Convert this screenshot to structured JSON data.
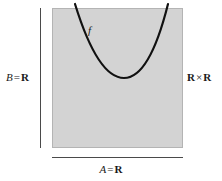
{
  "figure": {
    "background_color": "#ffffff",
    "square": {
      "name": "product-square",
      "fill_color": "#d3d3d3",
      "border_color": "#b4b4b4",
      "x": 52,
      "y": 8,
      "width": 131,
      "height": 140
    },
    "labels": {
      "domain": {
        "var": "A",
        "equals": "=",
        "set": "R",
        "full": "A = R",
        "position": "bottom"
      },
      "codomain": {
        "var": "B",
        "equals": "=",
        "set": "R",
        "full": "B = R",
        "position": "left"
      },
      "product": {
        "set_left": "R",
        "operator": "×",
        "set_right": "R",
        "full": "R × R",
        "position": "right"
      },
      "function": {
        "var": "f",
        "full": "f",
        "position": "curve"
      }
    },
    "curve": {
      "name": "function-graph-curve",
      "shape": "parabola",
      "stroke_color": "#111111",
      "stroke_width": 2.2,
      "vertex": [
        124,
        78
      ],
      "left_endpoint": [
        75,
        4
      ],
      "right_endpoint": [
        168,
        4
      ]
    },
    "rules": {
      "vertical": {
        "x": 40,
        "y_top": 8,
        "y_bottom": 148,
        "color": "#4a4a4a"
      },
      "horizontal": {
        "y": 157,
        "x_left": 52,
        "x_right": 183,
        "color": "#4a4a4a"
      }
    }
  }
}
